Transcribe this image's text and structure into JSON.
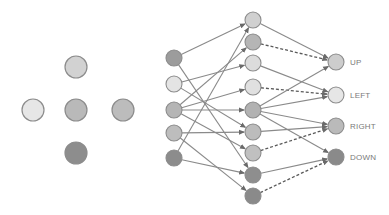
{
  "colors": {
    "light": "#e8e8e8",
    "mid_light": "#d4d4d4",
    "mid": "#b8b8b8",
    "dark": "#8a8a8a",
    "stroke": "#8c8c8c",
    "edge": "#8a8a8a",
    "dashed_edge": "#5a5a5a",
    "label": "#7a7a7a"
  },
  "cluster": {
    "nodes": [
      {
        "id": "c-top",
        "x": 76,
        "y": 67,
        "fill": "#d2d2d2"
      },
      {
        "id": "c-left",
        "x": 33,
        "y": 110,
        "fill": "#e6e6e6"
      },
      {
        "id": "c-center",
        "x": 76,
        "y": 110,
        "fill": "#b9b9b9"
      },
      {
        "id": "c-right",
        "x": 123,
        "y": 110,
        "fill": "#bcbcbc"
      },
      {
        "id": "c-bottom",
        "x": 76,
        "y": 153,
        "fill": "#8d8d8d"
      }
    ],
    "radius": 11
  },
  "inputs": {
    "nodes": [
      {
        "x": 174,
        "y": 58,
        "fill": "#9c9c9c"
      },
      {
        "x": 174,
        "y": 84,
        "fill": "#e4e4e4"
      },
      {
        "x": 174,
        "y": 110,
        "fill": "#b5b5b5"
      },
      {
        "x": 174,
        "y": 133,
        "fill": "#bdbdbd"
      },
      {
        "x": 174,
        "y": 158,
        "fill": "#8c8c8c"
      }
    ],
    "radius": 8
  },
  "hidden": {
    "nodes": [
      {
        "x": 253,
        "y": 20,
        "fill": "#d0d0d0"
      },
      {
        "x": 253,
        "y": 42,
        "fill": "#b5b5b5"
      },
      {
        "x": 253,
        "y": 63,
        "fill": "#dcdcdc"
      },
      {
        "x": 253,
        "y": 87,
        "fill": "#e0e0e0"
      },
      {
        "x": 253,
        "y": 110,
        "fill": "#b2b2b2"
      },
      {
        "x": 253,
        "y": 132,
        "fill": "#bcbcbc"
      },
      {
        "x": 253,
        "y": 153,
        "fill": "#c0c0c0"
      },
      {
        "x": 253,
        "y": 175,
        "fill": "#8e8e8e"
      },
      {
        "x": 253,
        "y": 196,
        "fill": "#8a8a8a"
      }
    ],
    "radius": 8
  },
  "outputs": {
    "nodes": [
      {
        "x": 336,
        "y": 62,
        "fill": "#cdcdcd",
        "label": "UP"
      },
      {
        "x": 336,
        "y": 95,
        "fill": "#e6e6e6",
        "label": "LEFT"
      },
      {
        "x": 336,
        "y": 126,
        "fill": "#bababa",
        "label": "RIGHT"
      },
      {
        "x": 336,
        "y": 157,
        "fill": "#8a8a8a",
        "label": "DOWN"
      }
    ],
    "radius": 8
  },
  "input_edges": [
    [
      0,
      0
    ],
    [
      0,
      7
    ],
    [
      1,
      2
    ],
    [
      1,
      5
    ],
    [
      2,
      4
    ],
    [
      2,
      6
    ],
    [
      2,
      3
    ],
    [
      2,
      1
    ],
    [
      3,
      5
    ],
    [
      3,
      8
    ],
    [
      4,
      0
    ],
    [
      4,
      7
    ]
  ],
  "hidden_edges": [
    {
      "from": 0,
      "to": 0,
      "dashed": false
    },
    {
      "from": 1,
      "to": 0,
      "dashed": true
    },
    {
      "from": 2,
      "to": 1,
      "dashed": false
    },
    {
      "from": 3,
      "to": 1,
      "dashed": true
    },
    {
      "from": 4,
      "to": 0,
      "dashed": false
    },
    {
      "from": 4,
      "to": 1,
      "dashed": false
    },
    {
      "from": 4,
      "to": 2,
      "dashed": false
    },
    {
      "from": 4,
      "to": 3,
      "dashed": false
    },
    {
      "from": 5,
      "to": 2,
      "dashed": false
    },
    {
      "from": 6,
      "to": 2,
      "dashed": true
    },
    {
      "from": 7,
      "to": 3,
      "dashed": false
    },
    {
      "from": 8,
      "to": 3,
      "dashed": true
    }
  ]
}
